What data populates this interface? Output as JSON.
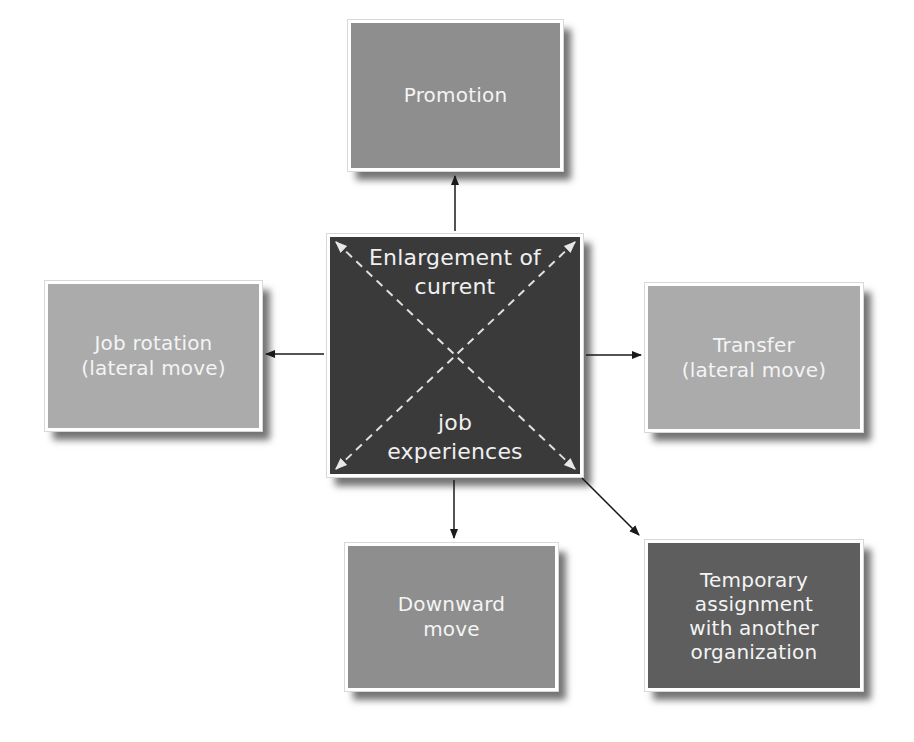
{
  "diagram": {
    "center": {
      "label_top": "Enlargement of\ncurrent",
      "label_bottom": "job\nexperiences",
      "color": "#3a3a3a"
    },
    "nodes": [
      {
        "id": "promotion",
        "label": "Promotion",
        "direction": "up",
        "color": "#8e8e8e"
      },
      {
        "id": "job-rotation",
        "label": "Job rotation\n(lateral move)",
        "direction": "left",
        "color": "#ababab"
      },
      {
        "id": "transfer",
        "label": "Transfer\n(lateral move)",
        "direction": "right",
        "color": "#ababab"
      },
      {
        "id": "downward-move",
        "label": "Downward\nmove",
        "direction": "down",
        "color": "#8e8e8e"
      },
      {
        "id": "temporary-assignment",
        "label": "Temporary\nassignment\nwith another\norganization",
        "direction": "down-right",
        "color": "#5e5e5e"
      }
    ],
    "edges": [
      {
        "from": "center",
        "to": "promotion"
      },
      {
        "from": "center",
        "to": "job-rotation"
      },
      {
        "from": "center",
        "to": "transfer"
      },
      {
        "from": "center",
        "to": "downward-move"
      },
      {
        "from": "center",
        "to": "temporary-assignment"
      }
    ]
  }
}
